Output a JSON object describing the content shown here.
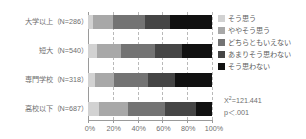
{
  "chart_data": {
    "type": "bar",
    "subtype": "stacked-horizontal-100percent",
    "title": "",
    "xlabel": "",
    "ylabel": "",
    "xlim": [
      0,
      100
    ],
    "grid": true,
    "grid_style": "dashed-vertical",
    "legend_position": "right",
    "categories": [
      "大学以上（N=286）",
      "短大（N=540）",
      "専門学校（N=318）",
      "高校以下（N=687）"
    ],
    "category_order_top_to_bottom": [
      "大学以上（N=286）",
      "短大（N=540）",
      "専門学校（N=318）",
      "高校以下（N=687）"
    ],
    "tick_labels": [
      "0%",
      "20%",
      "40%",
      "60%",
      "80%",
      "100%"
    ],
    "tick_values": [
      0,
      20,
      40,
      60,
      80,
      100
    ],
    "series": [
      {
        "name": "そう思う",
        "color": "#d2d2d2",
        "values": [
          4,
          7,
          6,
          9
        ]
      },
      {
        "name": "ややそう思う",
        "color": "#a8a8a8",
        "values": [
          16,
          20,
          15,
          23
        ]
      },
      {
        "name": "どちらともいえない",
        "color": "#737373",
        "values": [
          26,
          27,
          27,
          30
        ]
      },
      {
        "name": "あまりそう思わない",
        "color": "#454545",
        "values": [
          20,
          22,
          22,
          25
        ]
      },
      {
        "name": "そう思わない",
        "color": "#111111",
        "values": [
          34,
          24,
          30,
          13
        ]
      }
    ],
    "annotations": {
      "chi_square_symbol": "X",
      "chi_square_superscript": "2",
      "chi_square_text": "=121.441",
      "p_value_text": "p＜.001"
    }
  },
  "legend": {
    "items": [
      {
        "label": "そう思う",
        "swatch": "#d2d2d2"
      },
      {
        "label": "ややそう思う",
        "swatch": "#a8a8a8"
      },
      {
        "label": "どちらともいえない",
        "swatch": "#737373"
      },
      {
        "label": "あまりそう思わない",
        "swatch": "#454545"
      },
      {
        "label": "そう思わない",
        "swatch": "#111111"
      }
    ]
  }
}
